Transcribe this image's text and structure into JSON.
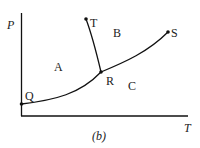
{
  "diagram": {
    "type": "phase-diagram",
    "caption": "(b)",
    "axes": {
      "x_label": "T",
      "y_label": "P"
    },
    "points": [
      {
        "id": "Q",
        "label": "Q"
      },
      {
        "id": "R",
        "label": "R"
      },
      {
        "id": "S",
        "label": "S"
      },
      {
        "id": "T",
        "label": "T"
      }
    ],
    "regions": [
      {
        "id": "A",
        "label": "A"
      },
      {
        "id": "B",
        "label": "B"
      },
      {
        "id": "C",
        "label": "C"
      }
    ],
    "curves": [
      {
        "from": "Q",
        "to": "R"
      },
      {
        "from": "R",
        "to": "S"
      },
      {
        "from": "R",
        "to": "T"
      }
    ],
    "colors": {
      "line": "#111111",
      "text": "#222222",
      "background": "#ffffff"
    }
  }
}
